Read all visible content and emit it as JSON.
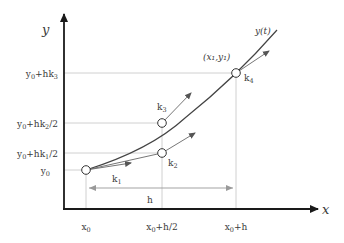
{
  "diagram": {
    "axes": {
      "x_label": "x",
      "y_label": "y"
    },
    "curve_label": "y(t)",
    "point_label": "(x₁,y₁)",
    "x_ticks": [
      {
        "base": "x",
        "sub": "0",
        "suffix": ""
      },
      {
        "base": "x",
        "sub": "0",
        "suffix": "+h/2"
      },
      {
        "base": "x",
        "sub": "0",
        "suffix": "+h"
      }
    ],
    "y_ticks": [
      {
        "base": "y",
        "sub": "0",
        "mid": "+hk",
        "ksub": "3",
        "suffix": ""
      },
      {
        "base": "y",
        "sub": "0",
        "mid": "+hk",
        "ksub": "2",
        "suffix": "/2"
      },
      {
        "base": "y",
        "sub": "0",
        "mid": "+hk",
        "ksub": "1",
        "suffix": "/2"
      },
      {
        "base": "y",
        "sub": "0",
        "mid": "",
        "ksub": "",
        "suffix": ""
      }
    ],
    "slopes": [
      {
        "name": "k",
        "sub": "1"
      },
      {
        "name": "k",
        "sub": "2"
      },
      {
        "name": "k",
        "sub": "3"
      },
      {
        "name": "k",
        "sub": "4"
      }
    ],
    "step_label": "h",
    "colors": {
      "axis": "#1a1a1a",
      "curve": "#444444",
      "guide": "#b5b5b5",
      "text": "#3a3a3a"
    }
  }
}
